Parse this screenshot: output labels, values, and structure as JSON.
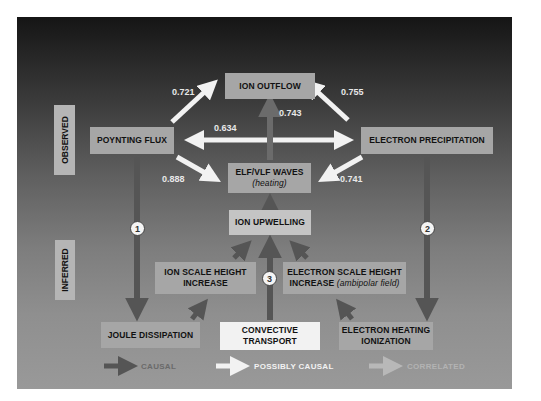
{
  "diagram": {
    "row_labels": {
      "observed": "OBSERVED",
      "inferred": "INFERRED"
    },
    "nodes": {
      "ion_outflow": "ION OUTFLOW",
      "poynting_flux": "POYNTING FLUX",
      "electron_precipitation": "ELECTRON PRECIPITATION",
      "elf_vlf_waves": "ELF/VLF WAVES",
      "elf_vlf_waves_note": "(heating)",
      "ion_upwelling": "ION UPWELLING",
      "ion_scale_height_line1": "ION SCALE HEIGHT",
      "ion_scale_height_line2": "INCREASE",
      "electron_scale_height_line1": "ELECTRON SCALE HEIGHT",
      "electron_scale_height_line2": "INCREASE",
      "electron_scale_height_note": "(ambipolar field)",
      "joule_dissipation": "JOULE DISSIPATION",
      "convective_transport_line1": "CONVECTIVE",
      "convective_transport_line2": "TRANSPORT",
      "electron_heating_line1": "ELECTRON HEATING",
      "electron_heating_line2": "IONIZATION"
    },
    "edge_values": {
      "poynting_to_outflow": "0.721",
      "precipitation_to_outflow": "0.755",
      "waves_to_outflow": "0.743",
      "poynting_precipitation": "0.634",
      "poynting_to_waves": "0.888",
      "precipitation_to_waves": "0.741"
    },
    "markers": {
      "path1": "1",
      "path2": "2",
      "path3": "3"
    },
    "legend": {
      "causal": "CAUSAL",
      "possibly_causal": "POSSIBLY CAUSAL",
      "correlated": "CORRELATED"
    },
    "colors": {
      "causal_arrow": "#555555",
      "possibly_causal_arrow": "#f2f2f2",
      "correlated_arrow": "#b0b0b0",
      "box_fill": "#a6a6a6"
    }
  }
}
